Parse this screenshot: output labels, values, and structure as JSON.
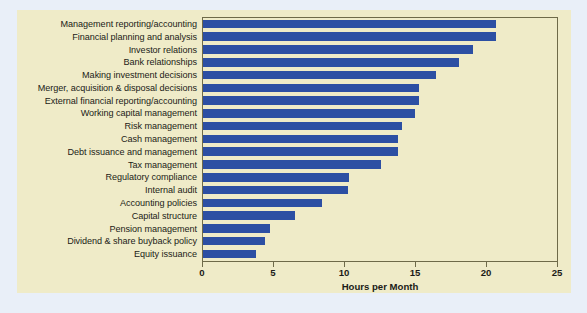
{
  "chart_data": {
    "type": "bar",
    "orientation": "horizontal",
    "title": "",
    "xlabel": "Hours per Month",
    "ylabel": "",
    "xlim": [
      0,
      25
    ],
    "xticks": [
      0,
      5,
      10,
      15,
      20,
      25
    ],
    "xtick_labels": [
      "0",
      "5",
      "10",
      "15",
      "20",
      "25"
    ],
    "grid": false,
    "legend": null,
    "bar_color": "#2c4fa3",
    "plot_background": "#efebc8",
    "figure_background": "#e9eff8",
    "categories": [
      "Management reporting/accounting",
      "Financial planning and analysis",
      "Investor relations",
      "Bank relationships",
      "Making investment decisions",
      "Merger, acquisition & disposal decisions",
      "External financial reporting/accounting",
      "Working capital management",
      "Risk management",
      "Cash management",
      "Debt issuance and management",
      "Tax management",
      "Regulatory compliance",
      "Internal audit",
      "Accounting policies",
      "Capital structure",
      "Pension management",
      "Dividend & share buyback policy",
      "Equity issuance"
    ],
    "values": [
      20.6,
      20.6,
      19.0,
      18.0,
      16.4,
      15.2,
      15.2,
      14.9,
      14.0,
      13.7,
      13.7,
      12.5,
      10.3,
      10.2,
      8.4,
      6.5,
      4.7,
      4.4,
      3.7
    ]
  }
}
